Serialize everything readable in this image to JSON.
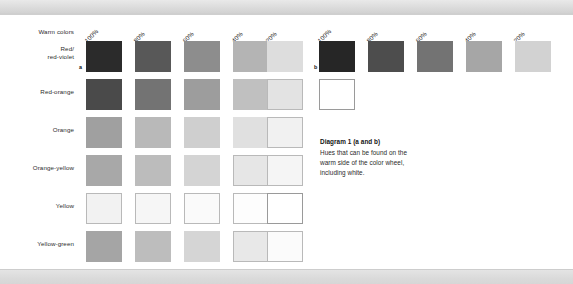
{
  "figure": {
    "warm_colors_label": "Warm colors",
    "row_labels": [
      "Red/\nred-violet",
      "Red-orange",
      "Orange",
      "Orange-yellow",
      "Yellow",
      "Yellow-green"
    ],
    "row_labels_flat": [
      "Red/",
      "red-violet",
      "Red-orange",
      "Orange",
      "Orange-yellow",
      "Yellow",
      "Yellow-green"
    ],
    "percent_headers": [
      "100%",
      "80%",
      "60%",
      "40%",
      "20%"
    ],
    "markers": {
      "a": "a",
      "b": "b"
    }
  },
  "caption": {
    "title": "Diagram 1 (a and b)",
    "line1": "Hues that can be found on the",
    "line2": "warm side of the color wheel,",
    "line3": "including white."
  },
  "chart_data": {
    "type": "heatmap",
    "title": "Diagram 1 (a and b)",
    "xlabel": "",
    "ylabel": "",
    "grids": [
      {
        "id": "a",
        "marker": "a",
        "columns": [
          "100%",
          "80%",
          "60%",
          "40%",
          "20%"
        ],
        "rows": [
          "Red/red-violet",
          "Red-orange",
          "Orange",
          "Orange-yellow",
          "Yellow",
          "Yellow-green"
        ],
        "values": [
          [
            "#2b2b2b",
            "#585858",
            "#8d8d8d",
            "#b4b4b4",
            "#dddddd"
          ],
          [
            "#4a4a4a",
            "#737373",
            "#9d9d9d",
            "#c0c0c0",
            "#e3e3e3"
          ],
          [
            "#a0a0a0",
            "#b9b9b9",
            "#cfcfcf",
            "#e0e0e0",
            "#f1f1f1"
          ],
          [
            "#a8a8a8",
            "#bcbcbc",
            "#d4d4d4",
            "#e6e6e6",
            "#f5f5f5"
          ],
          [
            "#f2f2f2",
            "#f6f6f6",
            "#fafafa",
            "#fdfdfd",
            "#ffffff"
          ],
          [
            "#a5a5a5",
            "#bdbdbd",
            "#d5d5d5",
            "#e8e8e8",
            "#fbfbfb"
          ]
        ]
      },
      {
        "id": "b",
        "marker": "b",
        "columns": [
          "100%",
          "80%",
          "60%",
          "40%",
          "20%"
        ],
        "rows": [
          "Red/red-violet",
          "White"
        ],
        "values": [
          [
            "#262626",
            "#4d4d4d",
            "#737373",
            "#a6a6a6",
            "#d2d2d2"
          ],
          [
            "#ffffff",
            null,
            null,
            null,
            null
          ]
        ]
      }
    ]
  },
  "grid_a": {
    "x_positions": [
      86,
      135,
      184,
      233,
      267
    ],
    "y_positions": [
      26,
      64,
      102,
      140,
      178,
      216
    ],
    "cells": [
      [
        "#2b2b2b",
        "#585858",
        "#8d8d8d",
        "#b4b4b4",
        "#dddddd"
      ],
      [
        "#4a4a4a",
        "#737373",
        "#9d9d9d",
        "#c0c0c0",
        "#e3e3e3"
      ],
      [
        "#a0a0a0",
        "#b9b9b9",
        "#cfcfcf",
        "#e0e0e0",
        "#f1f1f1"
      ],
      [
        "#a8a8a8",
        "#bcbcbc",
        "#d4d4d4",
        "#e6e6e6",
        "#f5f5f5"
      ],
      [
        "#f2f2f2",
        "#f6f6f6",
        "#fafafa",
        "#fdfdfd",
        "#ffffff"
      ],
      [
        "#a5a5a5",
        "#bdbdbd",
        "#d5d5d5",
        "#e8e8e8",
        "#fbfbfb"
      ]
    ]
  },
  "grid_b": {
    "cells_row1": [
      "#262626",
      "#4d4d4d",
      "#737373",
      "#a6a6a6",
      "#d2d2d2"
    ],
    "cell_white": "#ffffff"
  }
}
